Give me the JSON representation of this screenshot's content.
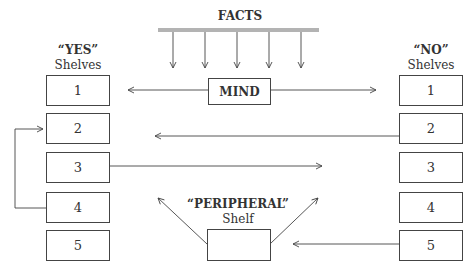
{
  "title": "FACTS",
  "center": {
    "label": "MIND"
  },
  "yes": {
    "heading": "“YES”",
    "subheading": "Shelves",
    "shelves": [
      "1",
      "2",
      "3",
      "4",
      "5"
    ]
  },
  "no": {
    "heading": "“NO”",
    "subheading": "Shelves",
    "shelves": [
      "1",
      "2",
      "3",
      "4",
      "5"
    ]
  },
  "peripheral": {
    "heading": "“PERIPHERAL”",
    "subheading": "Shelf",
    "label": ""
  },
  "colors": {
    "line": "#444444",
    "facts_bar": "#b3b3b3",
    "text": "#333333"
  },
  "arrows": [
    {
      "from": "facts",
      "to": "mind",
      "count": 5
    },
    {
      "from": "mind",
      "to": "yes-shelf-1"
    },
    {
      "from": "mind",
      "to": "no-shelf-1"
    },
    {
      "from": "no-shelf-2",
      "to": "left"
    },
    {
      "from": "yes-shelf-3",
      "to": "right"
    },
    {
      "from": "yes-shelf-4",
      "to": "yes-shelf-2"
    },
    {
      "from": "peripheral",
      "to": "up-left"
    },
    {
      "from": "peripheral",
      "to": "up-right"
    },
    {
      "from": "no-shelf-5",
      "to": "peripheral"
    }
  ]
}
